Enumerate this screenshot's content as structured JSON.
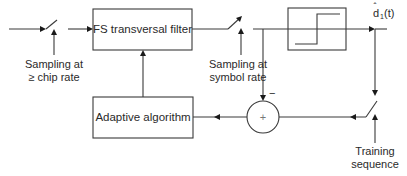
{
  "diagram": {
    "type": "block-diagram",
    "blocks": {
      "fs_filter": {
        "label": "FS transversal filter"
      },
      "adaptive": {
        "label": "Adaptive algorithm"
      },
      "decision": {
        "label": ""
      },
      "summer": {
        "symbol": "+",
        "minus_sign": "−"
      }
    },
    "labels": {
      "chip_sampling_line1": "Sampling at",
      "chip_sampling_line2": "≥ chip rate",
      "symbol_sampling_line1": "Sampling at",
      "symbol_sampling_line2": "symbol rate",
      "output_d": "d",
      "output_hat": "ˆ",
      "output_sub": "1",
      "output_arg": "(t)",
      "training_line1": "Training",
      "training_line2": "sequence"
    },
    "colors": {
      "stroke": "#3a3a3a",
      "text": "#2a2a2a",
      "background": "#ffffff"
    }
  }
}
